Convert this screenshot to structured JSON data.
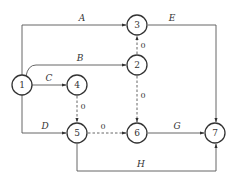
{
  "diagram": {
    "type": "activity-on-arrow network",
    "colors": {
      "stroke": "#333333",
      "edge": "#555555",
      "background": "#ffffff"
    },
    "nodes": [
      {
        "id": "1",
        "label": "1"
      },
      {
        "id": "2",
        "label": "2"
      },
      {
        "id": "3",
        "label": "3"
      },
      {
        "id": "4",
        "label": "4"
      },
      {
        "id": "5",
        "label": "5"
      },
      {
        "id": "6",
        "label": "6"
      },
      {
        "id": "7",
        "label": "7"
      }
    ],
    "edges": [
      {
        "from": "1",
        "to": "3",
        "label": "A",
        "style": "solid"
      },
      {
        "from": "1",
        "to": "2",
        "label": "B",
        "style": "solid"
      },
      {
        "from": "1",
        "to": "4",
        "label": "C",
        "style": "solid"
      },
      {
        "from": "1",
        "to": "5",
        "label": "D",
        "style": "solid"
      },
      {
        "from": "3",
        "to": "7",
        "label": "E",
        "style": "solid"
      },
      {
        "from": "6",
        "to": "7",
        "label": "G",
        "style": "solid"
      },
      {
        "from": "5",
        "to": "7",
        "label": "H",
        "style": "solid"
      },
      {
        "from": "2",
        "to": "3",
        "label": "0",
        "style": "dashed"
      },
      {
        "from": "2",
        "to": "6",
        "label": "0",
        "style": "dashed"
      },
      {
        "from": "4",
        "to": "5",
        "label": "0",
        "style": "dashed"
      },
      {
        "from": "5",
        "to": "6",
        "label": "0",
        "style": "dashed"
      }
    ]
  }
}
